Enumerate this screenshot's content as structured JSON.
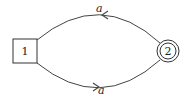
{
  "diagram": {
    "type": "finite-automaton",
    "nodes": [
      {
        "id": "1",
        "label": "1",
        "shape": "square",
        "initial": true
      },
      {
        "id": "2",
        "label": "2",
        "shape": "double-circle",
        "accepting": true
      }
    ],
    "edges": [
      {
        "from": "2",
        "to": "1",
        "label": "a",
        "position": "top"
      },
      {
        "from": "1",
        "to": "2",
        "label": "a",
        "position": "bottom"
      }
    ]
  },
  "colors": {
    "stroke": "#333333",
    "background": "#ffffff"
  }
}
